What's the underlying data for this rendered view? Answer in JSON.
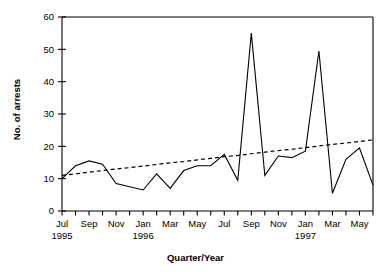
{
  "chart_data": {
    "type": "line",
    "title": "",
    "xlabel": "Quarter/Year",
    "ylabel": "No. of arrests",
    "ylim": [
      0,
      60
    ],
    "ytick_values": [
      0,
      10,
      20,
      30,
      40,
      50,
      60
    ],
    "ytick_labels": [
      "0",
      "10",
      "20",
      "30",
      "40",
      "50",
      "60"
    ],
    "grid": false,
    "legend_position": "none",
    "x": [
      "Jul 1995",
      "Aug 1995",
      "Sep 1995",
      "Oct 1995",
      "Nov 1995",
      "Dec 1995",
      "Jan 1996",
      "Feb 1996",
      "Mar 1996",
      "Apr 1996",
      "May 1996",
      "Jun 1996",
      "Jul 1996",
      "Aug 1996",
      "Sep 1996",
      "Oct 1996",
      "Nov 1996",
      "Dec 1996",
      "Jan 1997",
      "Feb 1997",
      "Mar 1997",
      "Apr 1997",
      "May 1997",
      "Jun 1997"
    ],
    "xtick_labels": [
      "Jul",
      "",
      "Sep",
      "",
      "Nov",
      "",
      "Jan",
      "",
      "Mar",
      "",
      "May",
      "",
      "Jul",
      "",
      "Sep",
      "",
      "Nov",
      "",
      "Jan",
      "",
      "Mar",
      "",
      "May",
      ""
    ],
    "xtick_year_labels": [
      {
        "index": 0,
        "label": "1995"
      },
      {
        "index": 6,
        "label": "1996"
      },
      {
        "index": 18,
        "label": "1997"
      }
    ],
    "series": [
      {
        "name": "No. of arrests",
        "style": "solid",
        "values": [
          10,
          14,
          15.5,
          14.5,
          8.5,
          7.5,
          6.5,
          11.5,
          7,
          12.5,
          14,
          14,
          17.5,
          9.5,
          55,
          11,
          17,
          16.5,
          18.5,
          49.5,
          5.5,
          16,
          19.5,
          8
        ]
      },
      {
        "name": "Trend line",
        "style": "dashed",
        "values": [
          11,
          11.5,
          12,
          12.5,
          13,
          13.4,
          13.9,
          14.4,
          14.9,
          15.3,
          15.8,
          16.3,
          16.8,
          17.2,
          17.7,
          18.2,
          18.7,
          19.1,
          19.6,
          20.1,
          20.6,
          21,
          21.5,
          22
        ]
      }
    ],
    "colors": {
      "axis": "#000000",
      "data_line": "#000000",
      "trend_line": "#000000",
      "background": "#ffffff"
    }
  }
}
